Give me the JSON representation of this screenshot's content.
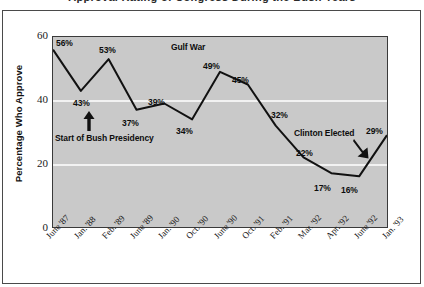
{
  "title_sliver": "Approval Rating of Congress During the Bush Years",
  "chart_data": {
    "type": "line",
    "title": "",
    "xlabel": "",
    "ylabel": "Percentage Who Approve",
    "ylim": [
      0,
      60
    ],
    "yticks": [
      "0",
      "20",
      "40",
      "60"
    ],
    "gridlines": [
      20,
      40
    ],
    "grid": true,
    "legend": "none",
    "categories": [
      "June '87",
      "Jan. '88",
      "Feb. '89",
      "June '89",
      "Jan. '90",
      "Oct. '90",
      "June '90",
      "Oct. '91",
      "Feb. '91",
      "Mar. '92",
      "Apr. '92",
      "June '92",
      "Jan. '93"
    ],
    "category_parts": [
      {
        "month": "June",
        "year": "'87"
      },
      {
        "month": "Jan.",
        "year": "'88"
      },
      {
        "month": "Feb.",
        "year": "'89"
      },
      {
        "month": "June",
        "year": "'89"
      },
      {
        "month": "Jan.",
        "year": "'90"
      },
      {
        "month": "Oct.",
        "year": "'90"
      },
      {
        "month": "June",
        "year": "'90"
      },
      {
        "month": "Oct.",
        "year": "'91"
      },
      {
        "month": "Feb.",
        "year": "'91"
      },
      {
        "month": "Mar.",
        "year": "'92"
      },
      {
        "month": "Apr.",
        "year": "'92"
      },
      {
        "month": "June",
        "year": "'92"
      },
      {
        "month": "Jan.",
        "year": "'93"
      }
    ],
    "values": [
      56,
      43,
      53,
      37,
      39,
      34,
      49,
      45,
      32,
      22,
      17,
      16,
      29
    ],
    "point_labels": [
      "56%",
      "43%",
      "53%",
      "37%",
      "39%",
      "34%",
      "49%",
      "45%",
      "32%",
      "22%",
      "17%",
      "16%",
      "29%"
    ],
    "annotations": [
      {
        "text": "Gulf War",
        "marker": "none"
      },
      {
        "text": "Start of Bush Presidency",
        "marker": "arrow-up"
      },
      {
        "text": "Clinton Elected",
        "marker": "arrow-down-right"
      }
    ],
    "colors": {
      "plot_background": "#c9c9c9",
      "line": "#111111",
      "gridline": "#f2f2f2",
      "axis": "#3a3a3a",
      "text": "#0d0d0d"
    }
  },
  "y_axis": {
    "ticks": [
      "60",
      "40",
      "20",
      "0"
    ],
    "title": "Percentage Who Approve"
  },
  "annotations": {
    "gulf_war": "Gulf War",
    "bush": "Start of Bush Presidency",
    "clinton": "Clinton Elected"
  }
}
